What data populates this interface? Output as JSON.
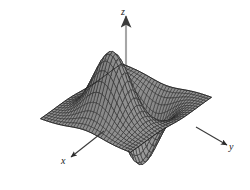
{
  "figure": {
    "kind": "3d-surface-wireframe-plot",
    "background_color": "#ffffff",
    "width": 250,
    "height": 190
  },
  "axes": {
    "z": {
      "label": "z",
      "arrow": "up",
      "color": "#9a9a9a"
    },
    "x": {
      "label": "x",
      "arrow": "down-left",
      "color": "#4a4a4a"
    },
    "y": {
      "label": "y",
      "arrow": "right",
      "color": "#4a4a4a"
    }
  },
  "surface": {
    "fill_color": "#8d8d8d",
    "fill_color_light": "#b4b4b4",
    "fill_color_dark": "#5c5c5c",
    "mesh_line_color": "#2b2b2b",
    "outline_color": "#1f1f1f",
    "grid_u_lines": 31,
    "grid_v_lines": 31,
    "description": "Grayscale wireframe mesh of a smooth two-variable function with a tall central ridge/peak rising toward the z-axis, a deep trough in front of it, and broad flat skirts falling away to the left and right."
  },
  "chart_data": {
    "type": "surface",
    "title": "",
    "xlabel": "x",
    "ylabel": "y",
    "zlabel": "z",
    "grid": true,
    "legend": null,
    "projection": {
      "type": "axonometric",
      "azimuth_deg": -52,
      "elevation_deg": 26,
      "x_axis_screen_direction": "down-left",
      "y_axis_screen_direction": "right",
      "z_axis_screen_direction": "up"
    },
    "xlim": [
      -3,
      3
    ],
    "ylim": [
      -3,
      3
    ],
    "zlim": [
      -0.5,
      1.05
    ],
    "nx": 31,
    "ny": 31,
    "surface_function": "z = x*exp(-(x^2+y^2)) scaled, producing one high ridge/peak and one adjacent deep valley",
    "features": [
      {
        "name": "peak",
        "x": -0.7,
        "y": 0.0,
        "z": 1.0,
        "screen_xy": [
          117,
          33
        ]
      },
      {
        "name": "valley",
        "x": 0.7,
        "y": 0.0,
        "z": -0.45,
        "screen_xy": [
          132,
          131
        ]
      },
      {
        "name": "left-skirt",
        "x": -3.0,
        "y": -3.0,
        "z": 0.02,
        "screen_xy": [
          22,
          104
        ]
      },
      {
        "name": "right-skirt",
        "x": -3.0,
        "y": 3.0,
        "z": 0.02,
        "screen_xy": [
          213,
          120
        ]
      },
      {
        "name": "front-corner",
        "x": 3.0,
        "y": 0.0,
        "z": 0.0,
        "screen_xy": [
          108,
          148
        ]
      }
    ]
  }
}
